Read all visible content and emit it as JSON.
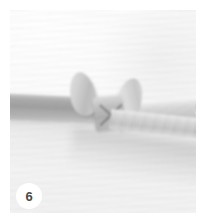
{
  "figure": {
    "name": "step-photo",
    "step_number": "6",
    "caption": "",
    "colors": {
      "background": "#ffffff",
      "fabric": "#f7f7f7",
      "ribbon_dark": "#9b9b9b",
      "ribbon_light": "#d6d6d6",
      "badge_background": "#ffffff",
      "badge_text": "#4a4a4a"
    }
  },
  "badge": {
    "label": "6"
  }
}
